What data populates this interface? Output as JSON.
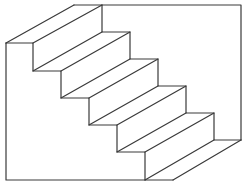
{
  "figure": {
    "width": 247,
    "height": 185,
    "stroke_color": "#3a3a3a",
    "background": "#ffffff",
    "offset": [
      68.5,
      -38
    ],
    "front_profile": [
      [
        6,
        43
      ],
      [
        33,
        43
      ],
      [
        33,
        71
      ],
      [
        61,
        71
      ],
      [
        61,
        98
      ],
      [
        89,
        98
      ],
      [
        89,
        125
      ],
      [
        117,
        125
      ],
      [
        117,
        152
      ],
      [
        145,
        152
      ],
      [
        145,
        180
      ],
      [
        173,
        180
      ]
    ],
    "back_profile": [
      [
        74,
        5
      ],
      [
        102,
        5
      ],
      [
        102,
        32
      ],
      [
        130,
        32
      ],
      [
        130,
        59
      ],
      [
        158,
        59
      ],
      [
        158,
        86
      ],
      [
        186,
        86
      ],
      [
        186,
        113
      ],
      [
        214,
        113
      ],
      [
        214,
        140
      ],
      [
        241,
        140
      ]
    ],
    "left_wall": [
      [
        6,
        43
      ],
      [
        6,
        180
      ],
      [
        145,
        180
      ]
    ],
    "back_wall": [
      [
        102,
        5
      ],
      [
        241,
        5
      ],
      [
        241,
        140
      ]
    ]
  }
}
